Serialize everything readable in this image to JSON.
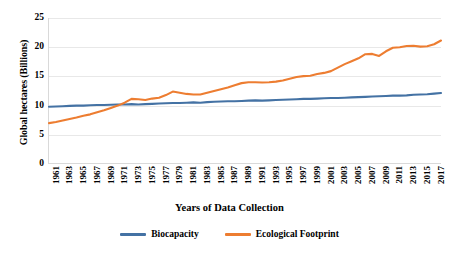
{
  "chart_data": {
    "type": "line",
    "title": "",
    "xlabel": "Years of Data Collection",
    "ylabel": "Global hectares (Billions)",
    "xlim": [
      1961,
      2018
    ],
    "ylim": [
      0,
      25
    ],
    "yticks": [
      0,
      5,
      10,
      15,
      20,
      25
    ],
    "grid": true,
    "legend_position": "bottom",
    "x": [
      1961,
      1962,
      1963,
      1964,
      1965,
      1966,
      1967,
      1968,
      1969,
      1970,
      1971,
      1972,
      1973,
      1974,
      1975,
      1976,
      1977,
      1978,
      1979,
      1980,
      1981,
      1982,
      1983,
      1984,
      1985,
      1986,
      1987,
      1988,
      1989,
      1990,
      1991,
      1992,
      1993,
      1994,
      1995,
      1996,
      1997,
      1998,
      1999,
      2000,
      2001,
      2002,
      2003,
      2004,
      2005,
      2006,
      2007,
      2008,
      2009,
      2010,
      2011,
      2012,
      2013,
      2014,
      2015,
      2016,
      2017,
      2018
    ],
    "xticks": [
      1961,
      1963,
      1965,
      1967,
      1969,
      1971,
      1973,
      1975,
      1977,
      1979,
      1981,
      1983,
      1985,
      1987,
      1989,
      1991,
      1993,
      1995,
      1997,
      1999,
      2001,
      2003,
      2005,
      2007,
      2009,
      2011,
      2013,
      2015,
      2017
    ],
    "series": [
      {
        "name": "Biocapacity",
        "color": "#4472A4",
        "values": [
          9.8,
          9.85,
          9.9,
          9.95,
          10.0,
          10.0,
          10.05,
          10.1,
          10.1,
          10.15,
          10.2,
          10.2,
          10.25,
          10.2,
          10.25,
          10.3,
          10.35,
          10.4,
          10.45,
          10.45,
          10.5,
          10.55,
          10.5,
          10.6,
          10.65,
          10.7,
          10.75,
          10.75,
          10.8,
          10.85,
          10.9,
          10.85,
          10.9,
          10.95,
          11.0,
          11.05,
          11.1,
          11.15,
          11.15,
          11.2,
          11.25,
          11.3,
          11.3,
          11.35,
          11.4,
          11.45,
          11.5,
          11.55,
          11.6,
          11.65,
          11.7,
          11.7,
          11.75,
          11.85,
          11.9,
          11.95,
          12.05,
          12.15
        ]
      },
      {
        "name": "Ecological Footprint",
        "color": "#ED7D31",
        "values": [
          7.0,
          7.2,
          7.45,
          7.7,
          7.95,
          8.25,
          8.5,
          8.85,
          9.2,
          9.6,
          10.0,
          10.5,
          11.15,
          11.1,
          10.95,
          11.2,
          11.35,
          11.8,
          12.4,
          12.2,
          12.0,
          11.9,
          11.9,
          12.2,
          12.5,
          12.8,
          13.1,
          13.5,
          13.85,
          14.0,
          14.0,
          13.95,
          14.0,
          14.1,
          14.3,
          14.6,
          14.9,
          15.05,
          15.1,
          15.4,
          15.6,
          15.9,
          16.5,
          17.1,
          17.6,
          18.1,
          18.8,
          18.85,
          18.5,
          19.3,
          19.9,
          20.0,
          20.2,
          20.25,
          20.1,
          20.15,
          20.5,
          21.15
        ]
      }
    ]
  },
  "axes": {
    "y_title": "Global hectares (Billions)",
    "x_title": "Years of Data Collection",
    "y_ticks": [
      "0",
      "5",
      "10",
      "15",
      "20",
      "25"
    ]
  },
  "legend": {
    "items": [
      {
        "label": "Biocapacity",
        "color": "#4472A4"
      },
      {
        "label": "Ecological Footprint",
        "color": "#ED7D31"
      }
    ]
  }
}
